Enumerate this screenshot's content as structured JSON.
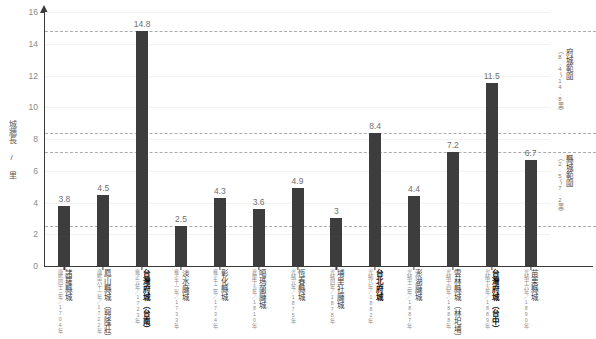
{
  "chart_data": {
    "type": "bar",
    "title": "",
    "xlabel": "",
    "ylabel": "城牆長 / 里",
    "ylim": [
      0,
      16
    ],
    "yticks": [
      "0",
      "2",
      "4",
      "6",
      "8",
      "10",
      "12",
      "14",
      "16"
    ],
    "grid": "dashed horizontal reference lines at 2.5, 7.2, 8.4, 14.8",
    "legend": "none",
    "categories": [
      "諸羅縣城",
      "鳳山縣城（興隆莊）",
      "台灣府城（台南）",
      "淡水廳城",
      "彰化縣城",
      "噶瑪蘭廳城",
      "恆春縣城",
      "埔里社廳城",
      "台北府城",
      "澎湖廳城",
      "雲林縣城（林圯埔）",
      "台灣府城（台中）",
      "苗栗縣城"
    ],
    "category_dates": [
      "康熙四十三年／1704年",
      "康熙六十一年／1722年",
      "雍正元年／1723年",
      "雍正十一年／1733年",
      "雍正十二年／1734年",
      "嘉慶十五年／1810年",
      "光緒元年／1875年",
      "光緒四年／1878年",
      "光緒八年／1882年",
      "光緒十三年／1887年",
      "光緒十四年／1888年",
      "光緒十五年／1889年",
      "光緒十六年／1890年"
    ],
    "values": [
      3.8,
      4.5,
      14.8,
      2.5,
      4.3,
      3.6,
      4.9,
      3,
      8.4,
      4.4,
      7.2,
      11.5,
      6.7
    ],
    "value_labels": [
      "3.8",
      "4.5",
      "14.8",
      "2.5",
      "4.3",
      "3.6",
      "4.9",
      "3",
      "8.4",
      "4.4",
      "7.2",
      "11.5",
      "6.7"
    ],
    "emphasized_categories": [
      "台灣府城（台南）",
      "台北府城",
      "台灣府城（台中）"
    ],
    "reference_lines": [
      2.5,
      7.2,
      8.4,
      14.8
    ],
    "annotations": [
      {
        "title": "府城範圍",
        "sub": "（8.4～14.8里）",
        "range": [
          8.4,
          14.8
        ]
      },
      {
        "title": "縣城範圍",
        "sub": "（2.5～7.2里）",
        "range": [
          2.5,
          7.2
        ]
      }
    ],
    "bar_color": "#3d3d3d",
    "gridline_color": "#9e9e9e",
    "axis_color": "#3a3a3a"
  }
}
